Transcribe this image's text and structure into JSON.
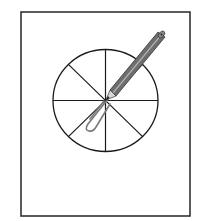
{
  "figure": {
    "sections": 8,
    "colors": {
      "background": "#ffffff",
      "frame": "#333333",
      "lines": "#1a1a1a",
      "pencil_body": "#6e6e6e",
      "pencil_stripe": "#9a9a9a",
      "paperclip": "#7a7a7a"
    }
  }
}
